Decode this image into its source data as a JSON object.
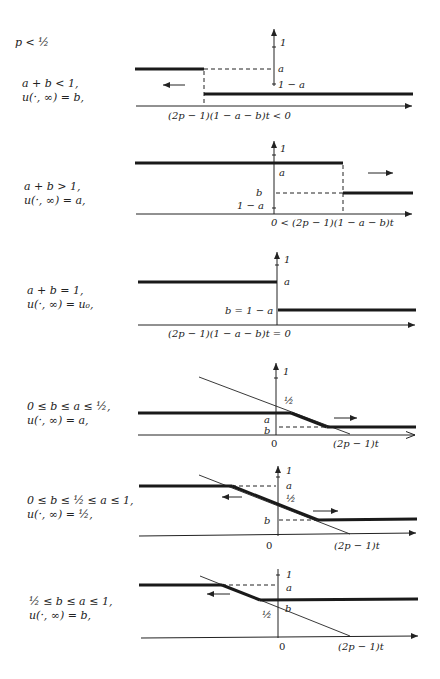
{
  "figure": {
    "header": "p < ½",
    "panels": [
      {
        "condition": "a + b < 1,",
        "limit": "u(·, ∞) = b,",
        "y_labels": [
          "1",
          "a",
          "1 − a"
        ],
        "x_label": "(2p − 1)(1 − a − b)t < 0",
        "arrow_direction": "left"
      },
      {
        "condition": "a + b > 1,",
        "limit": "u(·, ∞) = a,",
        "y_labels": [
          "1",
          "a",
          "b",
          "1 − a"
        ],
        "x_label": "0 < (2p − 1)(1 − a − b)t",
        "arrow_direction": "right"
      },
      {
        "condition": "a + b = 1,",
        "limit": "u(·, ∞) = u₀,",
        "y_labels": [
          "1",
          "a",
          "b = 1 − a"
        ],
        "x_label": "(2p − 1)(1 − a − b)t = 0",
        "arrow_direction": "none"
      },
      {
        "condition": "0 ≤ b ≤ a ≤ ½,",
        "limit": "u(·, ∞) = a,",
        "y_labels": [
          "1",
          "½",
          "a",
          "b"
        ],
        "origin_label": "0",
        "x_label": "(2p − 1)t",
        "arrow_direction": "right"
      },
      {
        "condition": "0 ≤ b ≤ ½ ≤ a ≤ 1,",
        "limit": "u(·, ∞) = ½,",
        "y_labels": [
          "1",
          "a",
          "½",
          "b"
        ],
        "origin_label": "0",
        "x_label": "(2p − 1)t",
        "arrow_direction": "both"
      },
      {
        "condition": "½ ≤ b ≤ a ≤ 1,",
        "limit": "u(·, ∞) = b,",
        "y_labels": [
          "1",
          "a",
          "b",
          "½"
        ],
        "origin_label": "0",
        "x_label": "(2p − 1)t",
        "arrow_direction": "left"
      }
    ]
  }
}
